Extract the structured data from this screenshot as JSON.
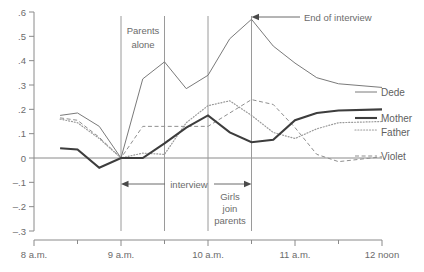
{
  "chart_data": {
    "type": "line",
    "title": "",
    "xlabel": "",
    "ylabel": "",
    "xlim": [
      8,
      12
    ],
    "ylim": [
      -0.3,
      0.6
    ],
    "grid": false,
    "legend_position": "right-inline",
    "x_tick_labels": [
      "8 a.m.",
      "9 a.m.",
      "10 a.m.",
      "11 a.m.",
      "12 noon"
    ],
    "x_tick_values": [
      8,
      9,
      10,
      11,
      12
    ],
    "x_minor_tick_values": [
      8.5,
      9.5,
      10.5,
      11.5
    ],
    "y_tick_labels": [
      ".6",
      ".5",
      ".4",
      ".3",
      ".2",
      ".1",
      "0",
      "–.1",
      "–.2",
      "–.3"
    ],
    "y_tick_values": [
      0.6,
      0.5,
      0.4,
      0.3,
      0.2,
      0.1,
      0.0,
      -0.1,
      -0.2,
      -0.3
    ],
    "x": [
      8.3,
      8.5,
      8.75,
      9.0,
      9.25,
      9.5,
      9.75,
      10.0,
      10.25,
      10.5,
      10.75,
      11.0,
      11.25,
      11.5,
      12.0
    ],
    "series": [
      {
        "name": "Dede",
        "style": "thin-solid",
        "values": [
          0.175,
          0.185,
          0.13,
          0.0,
          0.325,
          0.395,
          0.285,
          0.34,
          0.49,
          0.57,
          0.46,
          0.39,
          0.33,
          0.305,
          0.29
        ]
      },
      {
        "name": "Mother",
        "style": "thick-solid",
        "values": [
          0.04,
          0.035,
          -0.04,
          0.0,
          0.0,
          0.06,
          0.125,
          0.175,
          0.105,
          0.065,
          0.075,
          0.155,
          0.185,
          0.195,
          0.2
        ]
      },
      {
        "name": "Father",
        "style": "dotted",
        "values": [
          0.16,
          0.145,
          0.08,
          0.0,
          0.02,
          0.015,
          0.145,
          0.215,
          0.235,
          0.175,
          0.105,
          0.08,
          0.12,
          0.145,
          0.15
        ]
      },
      {
        "name": "Violet",
        "style": "dashed",
        "values": [
          0.165,
          0.155,
          0.085,
          0.0,
          0.13,
          0.13,
          0.13,
          0.13,
          0.185,
          0.24,
          0.22,
          0.125,
          0.015,
          -0.015,
          0.005
        ]
      }
    ],
    "vertical_markers": [
      {
        "x": 9.0,
        "label": ""
      },
      {
        "x": 9.5,
        "label": ""
      },
      {
        "x": 10.0,
        "label": ""
      },
      {
        "x": 10.5,
        "label": ""
      }
    ],
    "annotations": [
      {
        "id": "parents-alone",
        "text": "Parents alone",
        "lines": [
          "Parents",
          "alone"
        ],
        "x": 9.25,
        "y": 0.52
      },
      {
        "id": "end-of-interview",
        "text": "End of interview",
        "x": 10.5,
        "y": 0.575,
        "arrow": "to-left"
      },
      {
        "id": "interview",
        "text": "interview",
        "x_start": 9.0,
        "x_end": 10.5,
        "y": -0.105,
        "arrow": "double"
      },
      {
        "id": "girls-join-parents",
        "text": "Girls join parents",
        "lines": [
          "Girls",
          "join",
          "parents"
        ],
        "x": 10.25,
        "y": -0.2
      }
    ]
  },
  "legend": {
    "items": [
      {
        "label": "Dede",
        "style": "thin-solid"
      },
      {
        "label": "Mother",
        "style": "thick-solid"
      },
      {
        "label": "Father",
        "style": "dotted"
      },
      {
        "label": "Violet",
        "style": "dashed"
      }
    ]
  },
  "colors": {
    "axis": "#8a8a8a",
    "text": "#6b6b6b",
    "dede": "#7a7a7a",
    "mother": "#3d3d3d",
    "father": "#9a9a9a",
    "violet": "#8f8f8f",
    "marker_line": "#9a9a9a",
    "background": "#ffffff"
  }
}
